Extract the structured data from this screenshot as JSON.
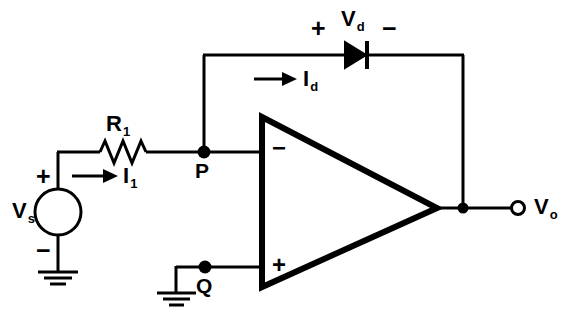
{
  "diagram": {
    "stroke_color": "#000000",
    "background_color": "#ffffff"
  },
  "source": {
    "label": "V",
    "label_sub": "s",
    "plus_sign": "+",
    "minus_sign": "−",
    "name": "voltage-source"
  },
  "resistor": {
    "label": "R",
    "label_sub": "1",
    "name": "resistor"
  },
  "currents": {
    "input": {
      "label": "I",
      "label_sub": "1"
    },
    "diode": {
      "label": "I",
      "label_sub": "d"
    }
  },
  "diode": {
    "voltage_label": "V",
    "voltage_label_sub": "d",
    "plus_sign": "+",
    "minus_sign": "−"
  },
  "nodes": {
    "p": "P",
    "q": "Q"
  },
  "opamp": {
    "inverting_sign": "−",
    "noninverting_sign": "+"
  },
  "output": {
    "label": "V",
    "label_sub": "o"
  }
}
